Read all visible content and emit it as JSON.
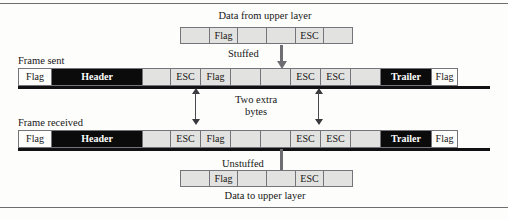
{
  "figure": {
    "labels": {
      "data_from_upper_layer": "Data from upper layer",
      "data_to_upper_layer": "Data to upper layer",
      "frame_sent": "Frame sent",
      "frame_received": "Frame received",
      "stuffed": "Stuffed",
      "unstuffed": "Unstuffed",
      "two_extra_bytes_line1": "Two extra",
      "two_extra_bytes_line2": "bytes"
    },
    "colors": {
      "byte_fill": "#e2e2e0",
      "byte_border": "#74747a",
      "header_trailer_fill": "#0b0b0b",
      "header_trailer_text": "#ffffff",
      "flag_fill": "#fdfdfc",
      "arrow": "#6d6d72",
      "page_background": "#fdfdfc"
    },
    "strips": {
      "data_from_upper_layer": {
        "name": "data-from-upper-layer-strip",
        "cells": [
          {
            "label": "",
            "style": "blank"
          },
          {
            "label": "Flag",
            "style": "blank"
          },
          {
            "label": "",
            "style": "blank"
          },
          {
            "label": "",
            "style": "blank"
          },
          {
            "label": "ESC",
            "style": "blank"
          },
          {
            "label": "",
            "style": "blank"
          }
        ]
      },
      "frame_sent": {
        "name": "frame-sent-strip",
        "cells": [
          {
            "label": "Flag",
            "style": "white",
            "width": 34
          },
          {
            "label": "Header",
            "style": "black",
            "width": 92
          },
          {
            "label": "",
            "style": "light",
            "width": 29
          },
          {
            "label": "ESC",
            "style": "light",
            "width": 31
          },
          {
            "label": "Flag",
            "style": "light",
            "width": 31
          },
          {
            "label": "",
            "style": "light",
            "width": 31
          },
          {
            "label": "",
            "style": "light",
            "width": 31
          },
          {
            "label": "ESC",
            "style": "light",
            "width": 31
          },
          {
            "label": "ESC",
            "style": "light",
            "width": 31
          },
          {
            "label": "",
            "style": "light",
            "width": 31
          },
          {
            "label": "Trailer",
            "style": "black",
            "width": 52
          },
          {
            "label": "Flag",
            "style": "white",
            "width": 27
          }
        ]
      },
      "frame_received": {
        "name": "frame-received-strip",
        "cells": [
          {
            "label": "Flag",
            "style": "white",
            "width": 34
          },
          {
            "label": "Header",
            "style": "black",
            "width": 92
          },
          {
            "label": "",
            "style": "light",
            "width": 29
          },
          {
            "label": "ESC",
            "style": "light",
            "width": 31
          },
          {
            "label": "Flag",
            "style": "light",
            "width": 31
          },
          {
            "label": "",
            "style": "light",
            "width": 31
          },
          {
            "label": "",
            "style": "light",
            "width": 31
          },
          {
            "label": "ESC",
            "style": "light",
            "width": 31
          },
          {
            "label": "ESC",
            "style": "light",
            "width": 31
          },
          {
            "label": "",
            "style": "light",
            "width": 31
          },
          {
            "label": "Trailer",
            "style": "black",
            "width": 52
          },
          {
            "label": "Flag",
            "style": "white",
            "width": 27
          }
        ]
      },
      "data_to_upper_layer": {
        "name": "data-to-upper-layer-strip",
        "cells": [
          {
            "label": "",
            "style": "blank"
          },
          {
            "label": "Flag",
            "style": "blank"
          },
          {
            "label": "",
            "style": "blank"
          },
          {
            "label": "",
            "style": "blank"
          },
          {
            "label": "ESC",
            "style": "blank"
          },
          {
            "label": "",
            "style": "blank"
          }
        ]
      }
    }
  }
}
